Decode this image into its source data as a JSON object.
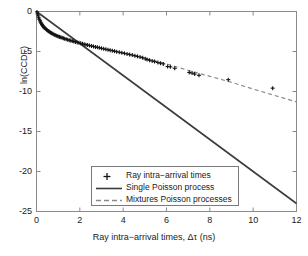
{
  "chart_data": {
    "type": "scatter",
    "title": "",
    "xlabel": "Ray intra−arrival times, Δτ (ns)",
    "ylabel": "ln(CCDF)",
    "xlim": [
      0,
      12
    ],
    "ylim": [
      -25,
      0
    ],
    "xticks": [
      0,
      2,
      4,
      6,
      8,
      10,
      12
    ],
    "yticks": [
      0,
      -5,
      -10,
      -15,
      -20,
      -25
    ],
    "xticklabels": [
      "0",
      "2",
      "4",
      "6",
      "8",
      "10",
      "12"
    ],
    "yticklabels": [
      "0",
      "-5",
      "-10",
      "-15",
      "-20",
      "-25"
    ],
    "grid": false,
    "legend_position": "lower center",
    "series": [
      {
        "name": "Ray intra-arrival times",
        "type": "scatter",
        "marker": "+",
        "color": "#141414",
        "points": [
          [
            0.02,
            -0.05
          ],
          [
            0.05,
            -0.3
          ],
          [
            0.08,
            -0.55
          ],
          [
            0.1,
            -0.78
          ],
          [
            0.13,
            -0.98
          ],
          [
            0.16,
            -1.16
          ],
          [
            0.19,
            -1.33
          ],
          [
            0.22,
            -1.48
          ],
          [
            0.25,
            -1.62
          ],
          [
            0.28,
            -1.74
          ],
          [
            0.31,
            -1.86
          ],
          [
            0.34,
            -1.97
          ],
          [
            0.38,
            -2.07
          ],
          [
            0.42,
            -2.17
          ],
          [
            0.46,
            -2.26
          ],
          [
            0.5,
            -2.35
          ],
          [
            0.54,
            -2.43
          ],
          [
            0.58,
            -2.51
          ],
          [
            0.62,
            -2.58
          ],
          [
            0.66,
            -2.65
          ],
          [
            0.7,
            -2.72
          ],
          [
            0.75,
            -2.79
          ],
          [
            0.8,
            -2.86
          ],
          [
            0.85,
            -2.93
          ],
          [
            0.9,
            -2.99
          ],
          [
            0.95,
            -3.05
          ],
          [
            1.0,
            -3.11
          ],
          [
            1.06,
            -3.17
          ],
          [
            1.12,
            -3.23
          ],
          [
            1.18,
            -3.29
          ],
          [
            1.24,
            -3.35
          ],
          [
            1.3,
            -3.4
          ],
          [
            1.37,
            -3.46
          ],
          [
            1.44,
            -3.52
          ],
          [
            1.51,
            -3.58
          ],
          [
            1.58,
            -3.63
          ],
          [
            1.65,
            -3.69
          ],
          [
            1.72,
            -3.75
          ],
          [
            1.8,
            -3.81
          ],
          [
            1.88,
            -3.86
          ],
          [
            1.96,
            -3.92
          ],
          [
            2.04,
            -3.98
          ],
          [
            2.12,
            -4.03
          ],
          [
            2.2,
            -4.09
          ],
          [
            2.28,
            -4.15
          ],
          [
            2.36,
            -4.2
          ],
          [
            2.45,
            -4.26
          ],
          [
            2.54,
            -4.31
          ],
          [
            2.63,
            -4.37
          ],
          [
            2.72,
            -4.43
          ],
          [
            2.81,
            -4.48
          ],
          [
            2.9,
            -4.54
          ],
          [
            3.0,
            -4.6
          ],
          [
            3.1,
            -4.66
          ],
          [
            3.2,
            -4.72
          ],
          [
            3.3,
            -4.78
          ],
          [
            3.4,
            -4.84
          ],
          [
            3.5,
            -4.9
          ],
          [
            3.6,
            -4.96
          ],
          [
            3.7,
            -5.02
          ],
          [
            3.82,
            -5.09
          ],
          [
            3.94,
            -5.16
          ],
          [
            4.06,
            -5.23
          ],
          [
            4.18,
            -5.3
          ],
          [
            4.3,
            -5.38
          ],
          [
            4.42,
            -5.45
          ],
          [
            4.54,
            -5.53
          ],
          [
            4.66,
            -5.61
          ],
          [
            4.78,
            -5.69
          ],
          [
            4.9,
            -5.78
          ],
          [
            5.02,
            -5.92
          ],
          [
            5.1,
            -6.0
          ],
          [
            5.22,
            -6.1
          ],
          [
            5.34,
            -6.18
          ],
          [
            5.45,
            -6.26
          ],
          [
            5.6,
            -6.38
          ],
          [
            5.72,
            -6.46
          ],
          [
            5.85,
            -6.55
          ],
          [
            6.05,
            -6.88
          ],
          [
            6.18,
            -6.92
          ],
          [
            6.38,
            -7.1
          ],
          [
            7.05,
            -7.62
          ],
          [
            7.18,
            -7.7
          ],
          [
            7.3,
            -7.82
          ],
          [
            7.5,
            -7.98
          ],
          [
            8.85,
            -8.52
          ],
          [
            10.9,
            -9.58
          ]
        ]
      },
      {
        "name": "Single Poisson process",
        "type": "line",
        "style": "solid",
        "color": "#3c3c3c",
        "points": [
          [
            0.0,
            0.0
          ],
          [
            12.0,
            -24.0
          ]
        ]
      },
      {
        "name": "Mixtures Poisson processes",
        "type": "line",
        "style": "dashed",
        "color": "#8c8c8c",
        "points": [
          [
            0.0,
            0.0
          ],
          [
            0.2,
            -1.4
          ],
          [
            0.5,
            -2.35
          ],
          [
            1.0,
            -3.11
          ],
          [
            1.5,
            -3.58
          ],
          [
            2.0,
            -3.96
          ],
          [
            3.0,
            -4.6
          ],
          [
            4.0,
            -5.2
          ],
          [
            5.0,
            -5.85
          ],
          [
            6.0,
            -6.55
          ],
          [
            7.0,
            -7.35
          ],
          [
            8.0,
            -8.1
          ],
          [
            9.0,
            -8.85
          ],
          [
            10.0,
            -9.7
          ],
          [
            11.0,
            -10.5
          ],
          [
            12.0,
            -11.3
          ]
        ]
      }
    ],
    "legend_entries": [
      {
        "label": "Ray intra−arrival times",
        "key": "plus-marker"
      },
      {
        "label": "Single Poisson process",
        "key": "solid-line"
      },
      {
        "label": "Mixtures Poisson processes",
        "key": "dashed-line"
      }
    ]
  },
  "axes": {
    "x_tick_labels": [
      "0",
      "2",
      "4",
      "6",
      "8",
      "10",
      "12"
    ],
    "y_tick_labels": [
      "0",
      "-5",
      "-10",
      "-15",
      "-20",
      "-25"
    ],
    "x_axis_title": "Ray intra−arrival times, Δτ (ns)",
    "y_axis_title": "ln(CCDF)"
  },
  "colors": {
    "axis": "#8a8a8a",
    "marker": "#141414",
    "solid_line": "#3c3c3c",
    "dashed_line": "#8c8c8c",
    "text": "#1a1a1a",
    "background": "#ffffff"
  }
}
